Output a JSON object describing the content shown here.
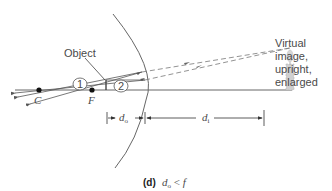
{
  "figure": {
    "caption_label": "(d)",
    "caption_var": "d",
    "caption_sub": "o",
    "caption_rel": " < ",
    "caption_f": "f"
  },
  "labels": {
    "object": "Object",
    "point_c": "C",
    "point_f": "F",
    "ray_1": "1",
    "ray_2": "2",
    "image_line1": "Virtual",
    "image_line2": "image,",
    "image_line3": "upright,",
    "image_line4": "enlarged",
    "d_o_var": "d",
    "d_o_sub": "o",
    "d_i_var": "d",
    "d_i_sub": "i"
  },
  "colors": {
    "line": "#555555",
    "mirror": "#666666",
    "point": "#111111",
    "image": "#c8c8c8"
  }
}
